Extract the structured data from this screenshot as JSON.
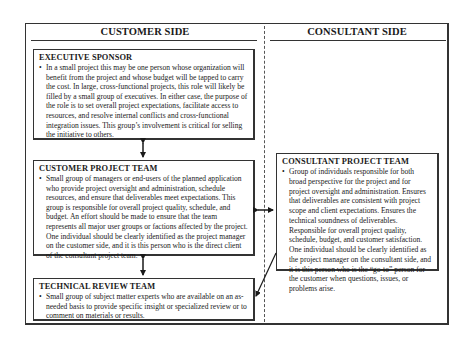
{
  "columns": {
    "left_header": "CUSTOMER SIDE",
    "right_header": "CONSULTANT SIDE"
  },
  "boxes": {
    "executive_sponsor": {
      "title": "EXECUTIVE SPONSOR",
      "bullet": "•",
      "text": "In a small project this may be one person whose organization will benefit from the project and whose budget will be tapped to carry the cost. In large, cross-functional projects, this role will likely be filled by a small group of executives. In either case, the purpose of the role is to set overall project expectations, facilitate access to resources, and resolve internal conflicts and cross-functional integration issues. This group’s involvement is critical for selling the initiative to others."
    },
    "customer_project_team": {
      "title": "CUSTOMER PROJECT TEAM",
      "bullet": "•",
      "text": "Small group of managers or end-users of the planned application who provide project oversight and administration, schedule resources, and ensure that deliverables meet expectations. This group is responsible for overall project quality, schedule, and budget. An effort should be made to ensure that the team represents all major user groups or factions affected by the project. One individual should be clearly identified as the project manager on the customer side, and it is this person who is the direct client of the consultant project team."
    },
    "technical_review_team": {
      "title": "TECHNICAL REVIEW TEAM",
      "bullet": "•",
      "text": "Small group of subject matter experts who are available on an as-needed basis to provide specific insight or specialized review or to comment on materials or results."
    },
    "consultant_project_team": {
      "title": "CONSULTANT PROJECT TEAM",
      "bullet": "•",
      "text": "Group of individuals responsible for both broad perspective for the project and for project oversight and administration. Ensures that deliverables are consistent with project scope and client expectations. Ensures the technical soundness of deliverables. Responsible for overall project quality, schedule, budget, and customer satisfaction. One individual should be clearly identified as the project manager on the consultant side, and it is this person who is the “go-to” person for the customer when questions, issues, or problems arise."
    }
  },
  "connections": [
    {
      "from": "executive_sponsor",
      "to": "customer_project_team",
      "type": "bidirectional"
    },
    {
      "from": "customer_project_team",
      "to": "technical_review_team",
      "type": "bidirectional"
    },
    {
      "from": "customer_project_team",
      "to": "consultant_project_team",
      "type": "bidirectional"
    },
    {
      "from": "consultant_project_team",
      "to": "technical_review_team",
      "type": "directed"
    }
  ]
}
